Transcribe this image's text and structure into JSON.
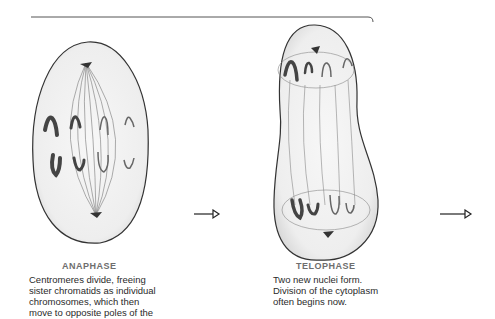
{
  "stages": [
    {
      "name": "ANAPHASE",
      "description_lines": [
        "Centromeres divide, freeing",
        "sister chromatids as individual",
        "chromosomes, which then",
        "move to opposite poles of the"
      ]
    },
    {
      "name": "TELOPHASE",
      "description_lines": [
        "Two new nuclei form.",
        "Division of the cytoplasm",
        "often begins now."
      ]
    }
  ],
  "arrows": [
    {
      "from": "ANAPHASE",
      "to": "TELOPHASE"
    },
    {
      "from": "TELOPHASE",
      "to": "next"
    }
  ]
}
